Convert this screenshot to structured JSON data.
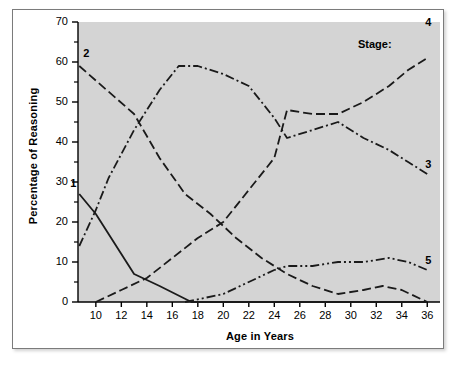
{
  "figure": {
    "background_color": "#ffffff",
    "plot_background_color": "#d4d4d4",
    "line_color": "#1a1a1a",
    "border_color": "#7b7b7b"
  },
  "chart_data": {
    "type": "line",
    "title": "",
    "xlabel": "Age in Years",
    "ylabel": "Percentage of Reasoning",
    "xlim": [
      8.6,
      37.0
    ],
    "ylim": [
      0,
      70
    ],
    "grid": false,
    "legend_position": "inline-right-labels",
    "legend_caption": "Stage:",
    "xticks": [
      10,
      12,
      14,
      16,
      18,
      20,
      22,
      24,
      26,
      28,
      30,
      32,
      34,
      36
    ],
    "yticks": [
      0,
      10,
      20,
      30,
      40,
      50,
      60,
      70
    ],
    "yticks_minor": [
      5,
      15,
      25,
      35,
      45,
      55,
      65
    ],
    "series": [
      {
        "name": "1",
        "label": "1",
        "style": "solid",
        "label_position": "left",
        "x": [
          8.7,
          10.0,
          11.0,
          13.0,
          15.0,
          17.5,
          36.0
        ],
        "values": [
          27,
          22,
          17,
          7,
          4,
          0,
          0
        ]
      },
      {
        "name": "2",
        "label": "2",
        "style": "dashed",
        "label_position": "top-left",
        "x": [
          8.7,
          13.0,
          15.0,
          17.0,
          19.0,
          21.0,
          23.0,
          25.0,
          27.0,
          29.0,
          31.0,
          32.5,
          34.0,
          36.0
        ],
        "values": [
          59,
          47,
          36,
          27,
          22,
          16,
          11,
          7,
          4,
          2,
          3,
          4,
          3,
          0
        ]
      },
      {
        "name": "3",
        "label": "3",
        "style": "dashdot",
        "label_position": "right",
        "x": [
          8.7,
          10.0,
          11.0,
          13.0,
          15.0,
          16.5,
          18.0,
          20.0,
          22.0,
          24.0,
          25.0,
          27.0,
          29.0,
          31.0,
          33.0,
          34.5,
          36.0
        ],
        "values": [
          14,
          23,
          31,
          43,
          53,
          59,
          59,
          57,
          54,
          46,
          41,
          43,
          45,
          41,
          38,
          35,
          32
        ]
      },
      {
        "name": "4",
        "label": "4",
        "style": "dashed",
        "label_position": "top-right",
        "x": [
          10.0,
          12.0,
          14.0,
          16.0,
          18.0,
          20.0,
          22.0,
          24.0,
          25.0,
          27.0,
          29.0,
          31.0,
          33.0,
          34.5,
          36.0
        ],
        "values": [
          0,
          3,
          6,
          11,
          16,
          20,
          28,
          36,
          48,
          47,
          47,
          50,
          54,
          58,
          61
        ]
      },
      {
        "name": "5",
        "label": "5",
        "style": "dashdotdot",
        "label_position": "right",
        "x": [
          17.0,
          18.5,
          20.0,
          22.0,
          24.0,
          25.0,
          27.0,
          29.0,
          31.0,
          33.0,
          34.5,
          36.0
        ],
        "values": [
          0,
          1,
          2,
          5,
          8,
          9,
          9,
          10,
          10,
          11,
          10,
          8
        ]
      }
    ]
  }
}
